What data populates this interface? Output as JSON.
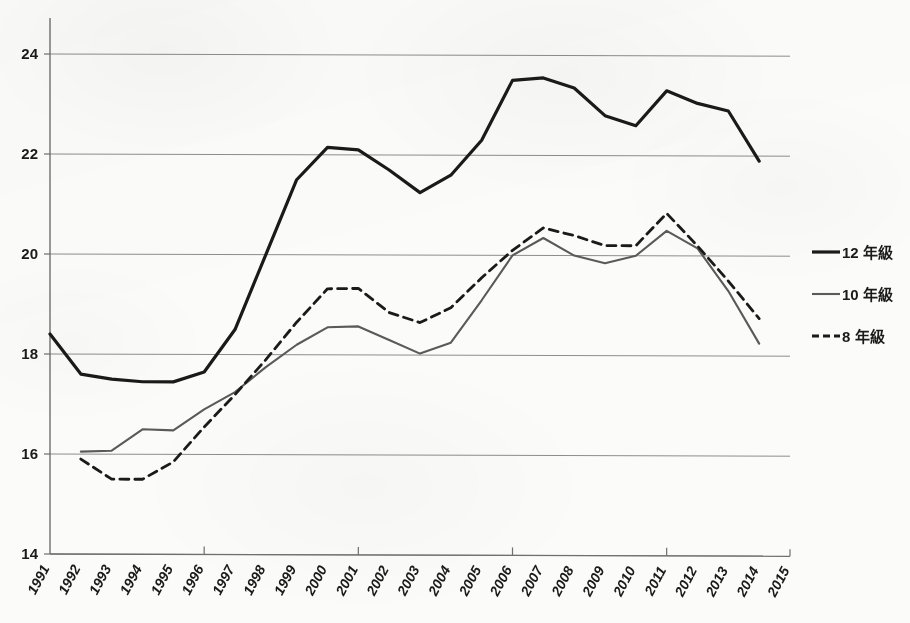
{
  "chart_data": {
    "type": "line",
    "title": "",
    "subtitle": "",
    "xlabel": "",
    "ylabel": "",
    "x": [
      1991,
      1992,
      1993,
      1994,
      1995,
      1996,
      1997,
      1998,
      1999,
      2000,
      2001,
      2002,
      2003,
      2004,
      2005,
      2006,
      2007,
      2008,
      2009,
      2010,
      2011,
      2012,
      2013,
      2014,
      2015
    ],
    "xtick_labels": [
      "1991",
      "1992",
      "1993",
      "1994",
      "1995",
      "1996",
      "1997",
      "1998",
      "1999",
      "2000",
      "2001",
      "2002",
      "2003",
      "2004",
      "2005",
      "2006",
      "2007",
      "2008",
      "2009",
      "2010",
      "2011",
      "2012",
      "2013",
      "2014",
      "2015"
    ],
    "ytick_labels": [
      "14",
      "16",
      "18",
      "20",
      "22",
      "24"
    ],
    "ytick_values": [
      14,
      16,
      18,
      20,
      22,
      24
    ],
    "xlim": [
      1991,
      2015
    ],
    "ylim": [
      14,
      24.9
    ],
    "grid": "horizontal",
    "legend_position": "right",
    "series": [
      {
        "name": "12 年級",
        "style": "solid",
        "color": "#1a1a1a",
        "width": 3.2,
        "x": [
          1991,
          1992,
          1993,
          1994,
          1995,
          1996,
          1997,
          1998,
          1999,
          2000,
          2001,
          2002,
          2003,
          2004,
          2005,
          2006,
          2007,
          2008,
          2009,
          2010,
          2011,
          2012,
          2013,
          2014
        ],
        "values": [
          18.4,
          17.6,
          17.5,
          17.45,
          17.45,
          17.65,
          18.5,
          20.0,
          21.5,
          22.15,
          22.1,
          21.7,
          21.25,
          21.6,
          22.3,
          23.5,
          23.55,
          23.35,
          22.8,
          22.6,
          23.3,
          23.05,
          22.9,
          21.9
        ]
      },
      {
        "name": "10 年級",
        "style": "solid",
        "color": "#5a5a5a",
        "width": 2.1,
        "x": [
          1992,
          1993,
          1994,
          1995,
          1996,
          1997,
          1998,
          1999,
          2000,
          2001,
          2002,
          2003,
          2004,
          2005,
          2006,
          2007,
          2008,
          2009,
          2010,
          2011,
          2012,
          2013,
          2014
        ],
        "values": [
          16.05,
          16.07,
          16.5,
          16.48,
          16.9,
          17.25,
          17.75,
          18.2,
          18.55,
          18.57,
          18.3,
          18.03,
          18.25,
          19.1,
          20.0,
          20.35,
          20.0,
          19.85,
          20.0,
          20.5,
          20.15,
          19.3,
          18.25
        ]
      },
      {
        "name": "8 年級",
        "style": "dashed",
        "color": "#1a1a1a",
        "width": 2.8,
        "x": [
          1992,
          1993,
          1994,
          1995,
          1996,
          1997,
          1998,
          1999,
          2000,
          2001,
          2002,
          2003,
          2004,
          2005,
          2006,
          2007,
          2008,
          2009,
          2010,
          2011,
          2012,
          2013,
          2014
        ],
        "values": [
          15.9,
          15.5,
          15.5,
          15.85,
          16.55,
          17.2,
          17.9,
          18.65,
          19.32,
          19.33,
          18.85,
          18.65,
          18.95,
          19.55,
          20.1,
          20.55,
          20.4,
          20.2,
          20.2,
          20.85,
          20.2,
          19.5,
          18.75
        ]
      }
    ]
  },
  "legend": {
    "items": [
      {
        "label": "12 年級",
        "style": "solid",
        "color": "#1a1a1a",
        "width": 3.2
      },
      {
        "label": "10 年級",
        "style": "solid",
        "color": "#5a5a5a",
        "width": 2.1
      },
      {
        "label": "8 年級",
        "style": "dashed",
        "color": "#1a1a1a",
        "width": 2.8
      }
    ]
  }
}
